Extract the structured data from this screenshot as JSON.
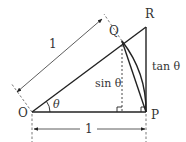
{
  "diagram": {
    "type": "geometry",
    "points": {
      "O": {
        "label": "O"
      },
      "P": {
        "label": "P"
      },
      "Q": {
        "label": "Q"
      },
      "R": {
        "label": "R"
      }
    },
    "labels": {
      "angle": "θ",
      "radius_oq": "1",
      "radius_op": "1",
      "sin": "sin θ",
      "tan": "tan θ"
    },
    "colors": {
      "line": "#222222",
      "text": "#333333",
      "background": "#ffffff"
    }
  }
}
